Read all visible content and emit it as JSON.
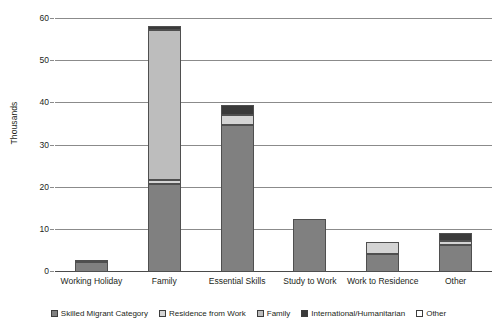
{
  "chart_data": {
    "type": "bar",
    "subtype": "stacked-column",
    "title": "",
    "xlabel": "",
    "ylabel": "Thousands",
    "ylim": [
      0,
      60
    ],
    "ytick_step": 10,
    "yticks": [
      "0",
      "10",
      "20",
      "30",
      "40",
      "50",
      "60"
    ],
    "grid": true,
    "legend_position": "bottom",
    "categories": [
      "Working Holiday",
      "Family",
      "Essential Skills",
      "Study to Work",
      "Work to Residence",
      "Other"
    ],
    "series": [
      {
        "name": "Skilled Migrant Category",
        "color": "#808080",
        "values": [
          2.3,
          20.9,
          34.8,
          12.5,
          4.2,
          6.4
        ]
      },
      {
        "name": "Residence from Work",
        "color": "#d4d4d4",
        "values": [
          0.4,
          1.0,
          2.4,
          0.0,
          3.0,
          1.0
        ]
      },
      {
        "name": "Family",
        "color": "#bdbdbd",
        "values": [
          0.0,
          35.6,
          0.0,
          0.0,
          0.0,
          0.0
        ]
      },
      {
        "name": "International/Humanitarian",
        "color": "#3a3a3a",
        "values": [
          0.0,
          0.9,
          2.3,
          0.0,
          0.0,
          1.9
        ]
      },
      {
        "name": "Other",
        "color": "#ffffff",
        "values": [
          0.0,
          0.0,
          0.0,
          0.0,
          0.0,
          0.0
        ]
      }
    ],
    "totals": [
      2.7,
      58.4,
      39.5,
      12.5,
      7.2,
      9.3
    ]
  },
  "legend": {
    "items": [
      {
        "label": "Skilled Migrant Category",
        "color": "#808080"
      },
      {
        "label": "Residence from Work",
        "color": "#d4d4d4"
      },
      {
        "label": "Family",
        "color": "#bdbdbd"
      },
      {
        "label": "International/Humanitarian",
        "color": "#3a3a3a"
      },
      {
        "label": "Other",
        "color": "#ffffff"
      }
    ]
  },
  "axis": {
    "y_title": "Thousands"
  }
}
